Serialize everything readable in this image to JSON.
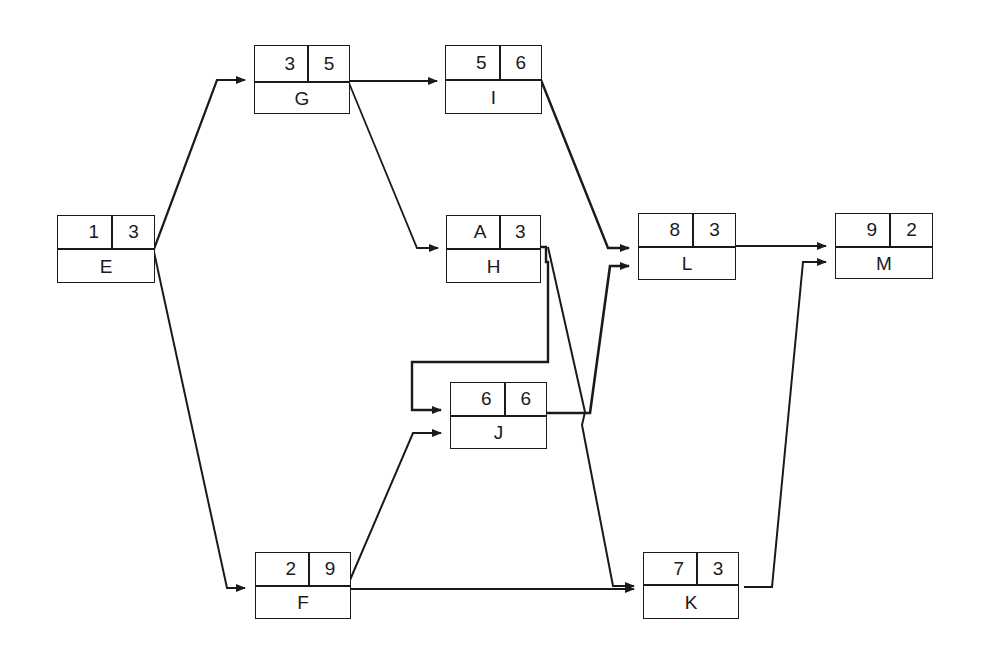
{
  "diagram": {
    "type": "activity-on-node network",
    "nodes": [
      {
        "id": "E",
        "label": "E",
        "top_left": "1",
        "top_right": "3",
        "x": 57,
        "y": 215,
        "w": 98,
        "h": 68,
        "split": 34
      },
      {
        "id": "G",
        "label": "G",
        "top_left": "3",
        "top_right": "5",
        "x": 254,
        "y": 45,
        "w": 96,
        "h": 69,
        "split": 37
      },
      {
        "id": "I",
        "label": "I",
        "top_left": "5",
        "top_right": "6",
        "x": 445,
        "y": 45,
        "w": 97,
        "h": 69,
        "split": 35
      },
      {
        "id": "H",
        "label": "H",
        "top_left": "A",
        "top_right": "3",
        "x": 446,
        "y": 215,
        "w": 95,
        "h": 68,
        "split": 34
      },
      {
        "id": "J",
        "label": "J",
        "top_left": "6",
        "top_right": "6",
        "x": 450,
        "y": 382,
        "w": 97,
        "h": 67,
        "split": 34
      },
      {
        "id": "L",
        "label": "L",
        "top_left": "8",
        "top_right": "3",
        "x": 638,
        "y": 213,
        "w": 98,
        "h": 67,
        "split": 34
      },
      {
        "id": "M",
        "label": "M",
        "top_left": "9",
        "top_right": "2",
        "x": 835,
        "y": 213,
        "w": 98,
        "h": 66,
        "split": 34
      },
      {
        "id": "F",
        "label": "F",
        "top_left": "2",
        "top_right": "9",
        "x": 255,
        "y": 552,
        "w": 96,
        "h": 67,
        "split": 34
      },
      {
        "id": "K",
        "label": "K",
        "top_left": "7",
        "top_right": "3",
        "x": 643,
        "y": 552,
        "w": 96,
        "h": 67,
        "split": 33
      }
    ],
    "edges": [
      {
        "from": "E",
        "to": "G",
        "points": "154,249 217,80 245,80",
        "width": 2.2
      },
      {
        "from": "E",
        "to": "F",
        "points": "154,252 227,588 245,588",
        "width": 2
      },
      {
        "from": "G",
        "to": "I",
        "points": "349,81 437,81",
        "width": 2
      },
      {
        "from": "G",
        "to": "H",
        "points": "349,83 417,248 438,248",
        "width": 1.8
      },
      {
        "from": "I",
        "to": "L",
        "points": "541,80 608,248 629,248",
        "width": 2.4
      },
      {
        "from": "H",
        "to": "J",
        "points": "540,247 546,247 546,262 548,262 548,362 412,362 412,410 441,410",
        "width": 2.4
      },
      {
        "from": "H",
        "to": "K",
        "points": "548,247 585,412 582,425 613,586 634,586",
        "width": 2
      },
      {
        "from": "F",
        "to": "J",
        "points": "350,580 413,433 441,433",
        "width": 2
      },
      {
        "from": "F",
        "to": "K",
        "points": "350,589 634,589",
        "width": 2.2
      },
      {
        "from": "J",
        "to": "L",
        "points": "546,413 590,413 610,266 629,266",
        "width": 2.6
      },
      {
        "from": "K",
        "to": "M",
        "points": "744,587 772,587 803,262 826,262",
        "width": 2
      },
      {
        "from": "L",
        "to": "M",
        "points": "735,246 826,246",
        "width": 1.8
      }
    ],
    "colors": {
      "line": "#1a1a1a",
      "background": "#ffffff"
    }
  }
}
